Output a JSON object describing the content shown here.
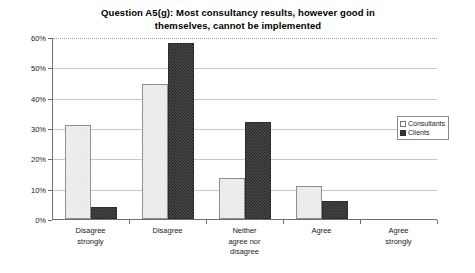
{
  "chart_data": {
    "type": "bar",
    "title": "Question A5(g): Most consultancy results, however good in themselves, cannot be implemented",
    "title_line1": "Question A5(g): Most consultancy results, however good in",
    "title_line2": "themselves, cannot be implemented",
    "categories": [
      "Disagree strongly",
      "Disagree",
      "Neither agree nor disagree",
      "Agree",
      "Agree strongly"
    ],
    "category_lines": [
      [
        "Disagree",
        "strongly"
      ],
      [
        "Disagree"
      ],
      [
        "Neither",
        "agree nor",
        "disagree"
      ],
      [
        "Agree"
      ],
      [
        "Agree",
        "strongly"
      ]
    ],
    "series": [
      {
        "name": "Consultants",
        "values": [
          31,
          44.5,
          13.5,
          11,
          0
        ],
        "color": "#f2f2f2"
      },
      {
        "name": "Clients",
        "values": [
          4,
          58,
          32,
          6,
          0
        ],
        "color": "#4a4a4a"
      }
    ],
    "xlabel": "",
    "ylabel": "",
    "ylim": [
      0,
      60
    ],
    "ytick_values": [
      0,
      10,
      20,
      30,
      40,
      50,
      60
    ],
    "ytick_labels": [
      "0%",
      "10%",
      "20%",
      "30%",
      "40%",
      "50%",
      "60%"
    ],
    "grid": true,
    "grid_axis": "y",
    "legend_position": "top-right-inside",
    "value_suffix": "%"
  },
  "legend": {
    "items": [
      {
        "label": "Consultants",
        "swatch": "legend-swatch-consultants"
      },
      {
        "label": "Clients",
        "swatch": "legend-swatch-clients"
      }
    ]
  }
}
